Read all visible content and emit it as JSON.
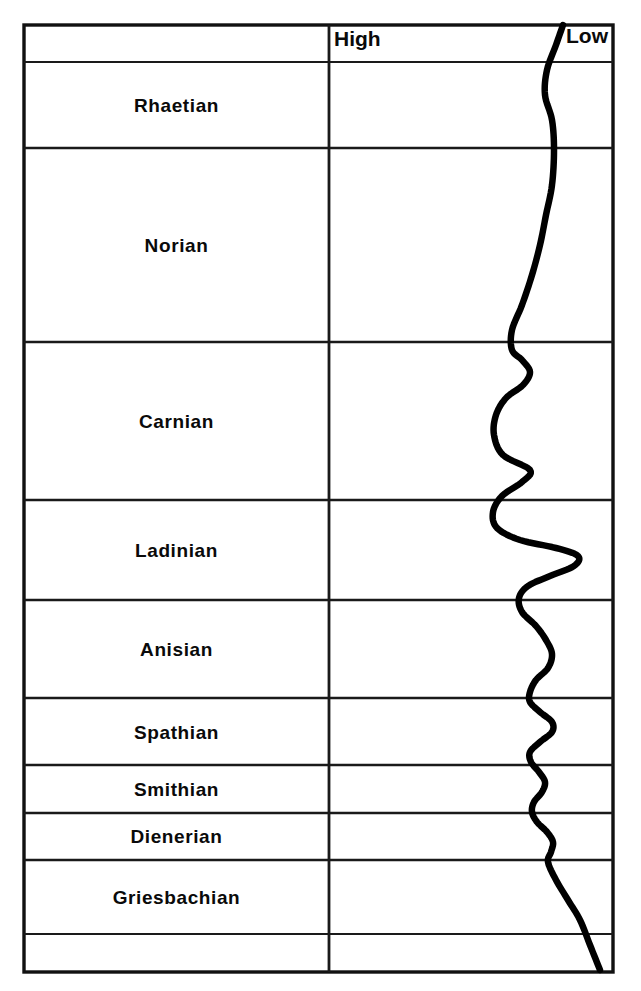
{
  "chart_data": {
    "type": "line",
    "title": "",
    "subtitle": "",
    "xlabel": "",
    "ylabel": "",
    "orientation": "vertical-stratigraphic-column",
    "grid": true,
    "legend": null,
    "axis": {
      "left_label": "High",
      "right_label": "Low",
      "direction": "sea level rises to the left (High) and falls to the right (Low)",
      "x_high_px": 329,
      "x_low_px": 613
    },
    "categories": [
      "Rhaetian",
      "Norian",
      "Carnian",
      "Ladinian",
      "Anisian",
      "Spathian",
      "Smithian",
      "Dienerian",
      "Griesbachian"
    ],
    "stages": [
      {
        "name": "Rhaetian",
        "top_px": 62,
        "bottom_px": 148
      },
      {
        "name": "Norian",
        "top_px": 148,
        "bottom_px": 342
      },
      {
        "name": "Carnian",
        "top_px": 342,
        "bottom_px": 500
      },
      {
        "name": "Ladinian",
        "top_px": 500,
        "bottom_px": 600
      },
      {
        "name": "Anisian",
        "top_px": 600,
        "bottom_px": 698
      },
      {
        "name": "Spathian",
        "top_px": 698,
        "bottom_px": 765
      },
      {
        "name": "Smithian",
        "top_px": 765,
        "bottom_px": 813
      },
      {
        "name": "Dienerian",
        "top_px": 813,
        "bottom_px": 860
      },
      {
        "name": "Griesbachian",
        "top_px": 860,
        "bottom_px": 934
      },
      {
        "name": "",
        "top_px": 934,
        "bottom_px": 972
      }
    ],
    "series": [
      {
        "name": "Relative sea level",
        "description": "Sea-level curve; x position in pixels, y position in pixels. Smaller x = higher sea level.",
        "points": [
          {
            "y": 25,
            "x": 563
          },
          {
            "y": 45,
            "x": 556
          },
          {
            "y": 70,
            "x": 547
          },
          {
            "y": 95,
            "x": 545
          },
          {
            "y": 120,
            "x": 552
          },
          {
            "y": 150,
            "x": 554
          },
          {
            "y": 185,
            "x": 552
          },
          {
            "y": 215,
            "x": 546
          },
          {
            "y": 245,
            "x": 540
          },
          {
            "y": 275,
            "x": 532
          },
          {
            "y": 305,
            "x": 522
          },
          {
            "y": 330,
            "x": 512
          },
          {
            "y": 350,
            "x": 512
          },
          {
            "y": 360,
            "x": 522
          },
          {
            "y": 372,
            "x": 530
          },
          {
            "y": 385,
            "x": 523
          },
          {
            "y": 398,
            "x": 506
          },
          {
            "y": 415,
            "x": 496
          },
          {
            "y": 435,
            "x": 494
          },
          {
            "y": 455,
            "x": 503
          },
          {
            "y": 470,
            "x": 530
          },
          {
            "y": 482,
            "x": 522
          },
          {
            "y": 496,
            "x": 502
          },
          {
            "y": 512,
            "x": 493
          },
          {
            "y": 528,
            "x": 497
          },
          {
            "y": 540,
            "x": 520
          },
          {
            "y": 548,
            "x": 556
          },
          {
            "y": 556,
            "x": 578
          },
          {
            "y": 566,
            "x": 574
          },
          {
            "y": 576,
            "x": 550
          },
          {
            "y": 586,
            "x": 528
          },
          {
            "y": 598,
            "x": 519
          },
          {
            "y": 612,
            "x": 522
          },
          {
            "y": 626,
            "x": 536
          },
          {
            "y": 640,
            "x": 546
          },
          {
            "y": 654,
            "x": 552
          },
          {
            "y": 668,
            "x": 548
          },
          {
            "y": 680,
            "x": 536
          },
          {
            "y": 692,
            "x": 530
          },
          {
            "y": 702,
            "x": 530
          },
          {
            "y": 712,
            "x": 540
          },
          {
            "y": 722,
            "x": 552
          },
          {
            "y": 732,
            "x": 552
          },
          {
            "y": 742,
            "x": 540
          },
          {
            "y": 752,
            "x": 530
          },
          {
            "y": 762,
            "x": 531
          },
          {
            "y": 772,
            "x": 539
          },
          {
            "y": 782,
            "x": 545
          },
          {
            "y": 792,
            "x": 542
          },
          {
            "y": 802,
            "x": 534
          },
          {
            "y": 812,
            "x": 532
          },
          {
            "y": 822,
            "x": 537
          },
          {
            "y": 832,
            "x": 547
          },
          {
            "y": 842,
            "x": 553
          },
          {
            "y": 852,
            "x": 551
          },
          {
            "y": 862,
            "x": 548
          },
          {
            "y": 880,
            "x": 556
          },
          {
            "y": 900,
            "x": 568
          },
          {
            "y": 920,
            "x": 580
          },
          {
            "y": 945,
            "x": 590
          },
          {
            "y": 970,
            "x": 600
          }
        ]
      }
    ],
    "colors": {
      "line": "#000000",
      "grid": "#1a1a1a",
      "background": "#ffffff",
      "text": "#0a0a0a"
    },
    "geometry": {
      "left_px": 24,
      "right_px": 613,
      "top_px": 25,
      "bottom_px": 972,
      "divider_px": 329,
      "header_bottom_px": 62
    }
  },
  "header": {
    "high_label": "High",
    "low_label": "Low"
  },
  "rows": {
    "r0": "Rhaetian",
    "r1": "Norian",
    "r2": "Carnian",
    "r3": "Ladinian",
    "r4": "Anisian",
    "r5": "Spathian",
    "r6": "Smithian",
    "r7": "Dienerian",
    "r8": "Griesbachian"
  }
}
